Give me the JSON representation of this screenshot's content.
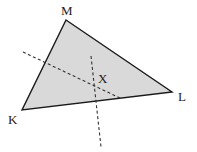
{
  "diagram": {
    "type": "triangle-with-perpendicular-bisectors",
    "fill_color": "#d9d9d9",
    "stroke_color": "#1a1a1a",
    "dash_color": "#333333",
    "vertices": {
      "M": {
        "label": "M",
        "x": 66,
        "y": 20,
        "label_x": 61,
        "label_y": 15
      },
      "K": {
        "label": "K",
        "x": 22,
        "y": 110,
        "label_x": 8,
        "label_y": 124
      },
      "L": {
        "label": "L",
        "x": 172,
        "y": 92,
        "label_x": 178,
        "label_y": 101
      }
    },
    "point_X": {
      "label": "X",
      "x": 96,
      "y": 86,
      "label_x": 98,
      "label_y": 83
    },
    "dashed_lines": [
      {
        "name": "bisector-KM",
        "x1": 23,
        "y1": 52,
        "x2": 120,
        "y2": 98
      },
      {
        "name": "bisector-KL",
        "x1": 91,
        "y1": 56,
        "x2": 101,
        "y2": 147
      }
    ]
  }
}
